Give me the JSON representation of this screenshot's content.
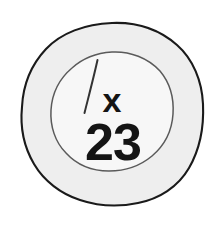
{
  "image": {
    "kind": "hand-drawn-annotation-stamp",
    "background_color": "#ffffff",
    "width": 221,
    "height": 229
  },
  "stamp": {
    "outer_ring": {
      "label": "outer circle",
      "fill_color": "#eeeeee",
      "stroke_color": "#1a1a1a",
      "center_x": 112,
      "center_y": 114,
      "radius": 90
    },
    "inner_ring": {
      "label": "inner circle",
      "fill_color": "#f7f7f7",
      "stroke_color": "#555555",
      "center_x": 112,
      "center_y": 112,
      "radius": 60
    },
    "slash_mark": {
      "label": "diagonal tick stroke",
      "stroke_color": "#333333",
      "x1": 97,
      "y1": 60,
      "x2": 84,
      "y2": 113
    },
    "marks": [
      {
        "name": "x-mark",
        "text": "x",
        "color": "#141414",
        "x": 112,
        "y": 112
      },
      {
        "name": "number-mark",
        "text": "23",
        "color": "#141414",
        "x": 113,
        "y": 160
      }
    ]
  }
}
